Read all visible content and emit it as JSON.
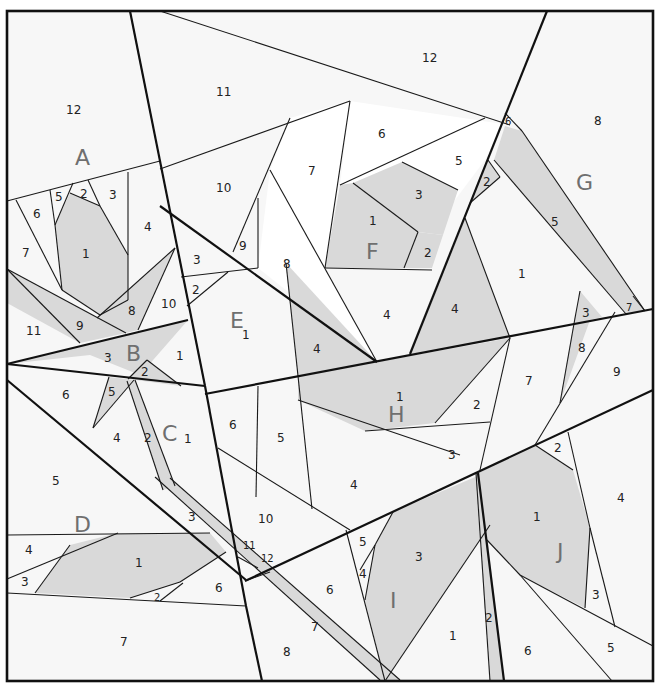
{
  "diagram": {
    "type": "foundation-paper-piecing-quilt-pattern",
    "colors": {
      "border": "#111111",
      "shaded_piece": "#d9d9d9",
      "plain_piece": "#f7f7f7",
      "white_piece": "#ffffff",
      "section_letter": "#6f6f6f",
      "piece_number": "#222222"
    },
    "sections": {
      "A": {
        "letter": "A",
        "pieces": [
          "1",
          "2",
          "3",
          "4",
          "5",
          "6",
          "7",
          "8",
          "9",
          "10",
          "11",
          "12"
        ]
      },
      "B": {
        "letter": "B",
        "pieces": [
          "1",
          "2",
          "3"
        ]
      },
      "C": {
        "letter": "C",
        "pieces": [
          "1",
          "2",
          "3",
          "4",
          "5",
          "6"
        ]
      },
      "D": {
        "letter": "D",
        "pieces": [
          "1",
          "2",
          "3",
          "4",
          "5",
          "6",
          "7"
        ]
      },
      "E": {
        "letter": "E",
        "pieces": [
          "1",
          "2",
          "3",
          "4",
          "5",
          "6",
          "7",
          "8",
          "9",
          "10",
          "11",
          "12"
        ]
      },
      "F": {
        "letter": "F",
        "pieces": [
          "1",
          "2",
          "3",
          "4",
          "5",
          "6"
        ]
      },
      "G": {
        "letter": "G",
        "pieces": [
          "1",
          "2",
          "3",
          "4",
          "5",
          "6",
          "7",
          "8"
        ]
      },
      "H": {
        "letter": "H",
        "pieces": [
          "1",
          "2",
          "3",
          "4",
          "5",
          "6",
          "7",
          "8",
          "9"
        ]
      },
      "I": {
        "letter": "I",
        "pieces": [
          "1",
          "2",
          "3",
          "4",
          "5",
          "6",
          "7",
          "8",
          "10",
          "11",
          "12"
        ]
      },
      "J": {
        "letter": "J",
        "pieces": [
          "1",
          "2",
          "3",
          "4",
          "5",
          "6"
        ]
      }
    },
    "labels": {
      "A": {
        "letter": "A",
        "p12": "12",
        "p1": "1",
        "p2": "2",
        "p3": "3",
        "p4": "4",
        "p5": "5",
        "p6": "6",
        "p7": "7",
        "p8": "8",
        "p9": "9",
        "p10": "10",
        "p11": "11"
      },
      "B": {
        "letter": "B",
        "p1": "1",
        "p2": "2",
        "p3": "3"
      },
      "C": {
        "letter": "C",
        "p1": "1",
        "p2": "2",
        "p3": "3",
        "p4": "4",
        "p5": "5",
        "p6": "6"
      },
      "D": {
        "letter": "D",
        "p1": "1",
        "p2": "2",
        "p3": "3",
        "p4": "4",
        "p5": "5",
        "p6": "6",
        "p7": "7"
      },
      "E": {
        "letter": "E",
        "p1": "1",
        "p2": "2",
        "p3": "3",
        "p4": "4",
        "p7": "7",
        "p8": "8",
        "p9": "9",
        "p10": "10",
        "p11": "11",
        "p12": "12"
      },
      "F": {
        "letter": "F",
        "p1": "1",
        "p2": "2",
        "p3": "3",
        "p4": "4",
        "p5": "5",
        "p6": "6"
      },
      "G": {
        "letter": "G",
        "p1": "1",
        "p2": "2",
        "p3": "3",
        "p4": "4",
        "p5": "5",
        "p6": "6",
        "p7": "7",
        "p8": "8"
      },
      "H": {
        "letter": "H",
        "p1": "1",
        "p2": "2",
        "p3": "3",
        "p4": "4",
        "p5": "5",
        "p6": "6",
        "p7": "7",
        "p8": "8",
        "p9": "9",
        "p10": "10"
      },
      "I": {
        "letter": "I",
        "p1": "1",
        "p2": "2",
        "p3": "3",
        "p4": "4",
        "p5": "5",
        "p6": "6",
        "p7": "7",
        "p8": "8",
        "p11": "11",
        "p12": "12"
      },
      "J": {
        "letter": "J",
        "p1": "1",
        "p2": "2",
        "p3": "3",
        "p4": "4",
        "p5": "5",
        "p6": "6"
      }
    }
  }
}
